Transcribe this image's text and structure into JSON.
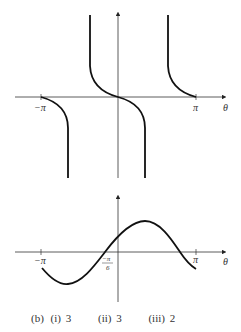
{
  "figure": {
    "top_graph": {
      "x_axis_label": "θ",
      "tick_labels": [
        "−π",
        "π"
      ],
      "description": "Graph with branches approaching asymptotes between −π and π"
    },
    "bottom_graph": {
      "x_axis_label": "θ",
      "tick_labels": [
        "−π",
        "−π/6",
        "π"
      ],
      "minus_pi_over_6": {
        "numerator": "−π",
        "denominator": "6"
      },
      "description": "Sinusoidal curve crossing x-axis at −π/6"
    },
    "caption": {
      "part": "(b)",
      "answers": [
        {
          "label": "(i)",
          "value": "3"
        },
        {
          "label": "(ii)",
          "value": "3"
        },
        {
          "label": "(iii)",
          "value": "2"
        }
      ]
    }
  }
}
